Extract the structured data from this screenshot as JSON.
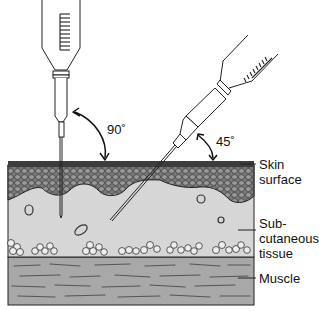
{
  "diagram": {
    "type": "medical-illustration",
    "angles": {
      "vertical": "90˚",
      "angled": "45˚"
    },
    "labels": {
      "skin": "Skin\nsurface",
      "subcutaneous": "Sub-\ncutaneous\ntissue",
      "muscle": "Muscle"
    },
    "colors": {
      "skin_layer": "#5a5a5a",
      "subcutaneous": "#d6d6d6",
      "muscle": "#a8a8a8",
      "line": "#222222",
      "background": "#ffffff"
    }
  }
}
